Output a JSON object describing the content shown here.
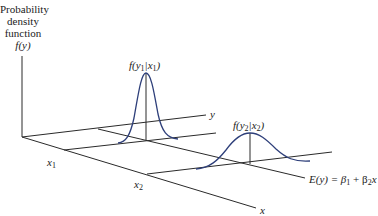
{
  "diagram": {
    "axis_label": {
      "line1": "Probability",
      "line2": "density",
      "line3": "function",
      "line4": "f(y)"
    },
    "y_axis_label": "y",
    "x_axis_label": "x",
    "x1_label": "x",
    "x1_sub": "1",
    "x2_label": "x",
    "x2_sub": "2",
    "curve1_label": "f(y",
    "curve1_sub1": "1",
    "curve1_mid": "|x",
    "curve1_sub2": "1",
    "curve1_end": ")",
    "curve2_label": "f(y",
    "curve2_sub1": "2",
    "curve2_mid": "|x",
    "curve2_sub2": "2",
    "curve2_end": ")",
    "regression_label": "E(y) = β",
    "regression_sub1": "1",
    "regression_mid": " + β",
    "regression_sub2": "2",
    "regression_end": "x",
    "colors": {
      "axes": "#2a2a2a",
      "curve": "#2e3f7a"
    }
  }
}
